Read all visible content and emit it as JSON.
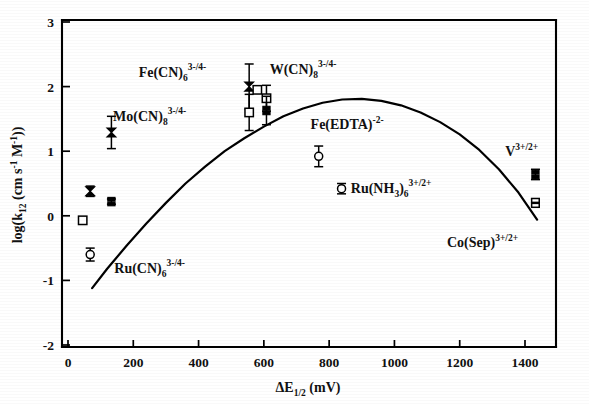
{
  "figure": {
    "background_color": "#ffffff",
    "ink_color": "#000000"
  },
  "axes": {
    "x_title_main": "E",
    "x_title_delta": "Δ",
    "x_title_sub": "1/2",
    "x_title_units": "(mV)",
    "x_title_full": "ΔE1/2 (mV)",
    "y_title_pre": "log(k",
    "y_title_sub": "12",
    "y_title_mid": " (cm s",
    "y_title_sup1": "-1",
    "y_title_mid2": " M",
    "y_title_sup2": "-1",
    "y_title_end": "))",
    "y_title_full": "log(k12 (cm s-1 M-1))",
    "x_ticks": [
      "0",
      "200",
      "400",
      "600",
      "800",
      "1000",
      "1200",
      "1400"
    ],
    "y_ticks": [
      "3",
      "2",
      "1",
      "0",
      "-1",
      "-2"
    ]
  },
  "chart_data": {
    "type": "scatter",
    "title": "",
    "xlabel": "ΔE1/2 (mV)",
    "ylabel": "log(k12 (cm s^-1 M^-1))",
    "xlim": [
      -40,
      1500
    ],
    "ylim": [
      -2,
      3.1
    ],
    "xticks": [
      0,
      200,
      400,
      600,
      800,
      1000,
      1200,
      1400
    ],
    "yticks": [
      -2,
      -1,
      0,
      1,
      2,
      3
    ],
    "grid": false,
    "legend": "none",
    "annotations": [
      {
        "name": "Ru(CN)6",
        "base": "Ru(CN)",
        "sub": "6",
        "sup": "3-/4-",
        "label": "Ru(CN)6 3-/4-",
        "x": 250,
        "y": -0.88
      },
      {
        "name": "Mo(CN)8",
        "base": "Mo(CN)",
        "sub": "8",
        "sup": "3-/4-",
        "label": "Mo(CN)8 3-/4-",
        "x": 250,
        "y": 1.46
      },
      {
        "name": "Fe(CN)6",
        "base": "Fe(CN)",
        "sub": "6",
        "sup": "3-/4-",
        "label": "Fe(CN)6 3-/4-",
        "x": 320,
        "y": 2.15
      },
      {
        "name": "W(CN)8",
        "base": "W(CN)",
        "sub": "8",
        "sup": "3-/4-",
        "label": "W(CN)8 3-/4-",
        "x": 720,
        "y": 2.2
      },
      {
        "name": "Fe(EDTA)",
        "base": "Fe(EDTA)",
        "sub": "",
        "sup": "-2-",
        "label": "Fe(EDTA) -2-",
        "x": 855,
        "y": 1.34
      },
      {
        "name": "Ru(NH3)6",
        "base": "Ru(NH",
        "sub": "3",
        "base2": ")",
        "sub2": "6",
        "sup": "3+/2+",
        "label": "Ru(NH3)6 3+/2+",
        "x": 990,
        "y": 0.35
      },
      {
        "name": "V",
        "base": "V",
        "sub": "",
        "sup": "3+/2+",
        "label": "V 3+/2+",
        "x": 1390,
        "y": 0.92
      },
      {
        "name": "Co(Sep)",
        "base": "Co(Sep)",
        "sub": "",
        "sup": "3+/2+",
        "label": "Co(Sep) 3+/2+",
        "x": 1270,
        "y": -0.48
      }
    ],
    "series": [
      {
        "name": "Marcus cross-relation fit",
        "type": "line",
        "points": [
          {
            "x": 74,
            "y": -1.12
          },
          {
            "x": 120,
            "y": -0.82
          },
          {
            "x": 180,
            "y": -0.46
          },
          {
            "x": 240,
            "y": -0.12
          },
          {
            "x": 300,
            "y": 0.2
          },
          {
            "x": 360,
            "y": 0.5
          },
          {
            "x": 420,
            "y": 0.76
          },
          {
            "x": 480,
            "y": 1.0
          },
          {
            "x": 540,
            "y": 1.2
          },
          {
            "x": 600,
            "y": 1.38
          },
          {
            "x": 660,
            "y": 1.54
          },
          {
            "x": 720,
            "y": 1.66
          },
          {
            "x": 780,
            "y": 1.75
          },
          {
            "x": 840,
            "y": 1.8
          },
          {
            "x": 900,
            "y": 1.81
          },
          {
            "x": 960,
            "y": 1.78
          },
          {
            "x": 1020,
            "y": 1.71
          },
          {
            "x": 1080,
            "y": 1.6
          },
          {
            "x": 1140,
            "y": 1.45
          },
          {
            "x": 1200,
            "y": 1.26
          },
          {
            "x": 1260,
            "y": 1.02
          },
          {
            "x": 1320,
            "y": 0.72
          },
          {
            "x": 1380,
            "y": 0.36
          },
          {
            "x": 1437,
            "y": -0.06
          }
        ]
      },
      {
        "name": "measured rate constants",
        "type": "scatter",
        "points": [
          {
            "x": 68,
            "y": 0.38,
            "marker": "filled-bowtie",
            "yerr": 0.08
          },
          {
            "x": 45,
            "y": -0.07,
            "marker": "open-square",
            "yerr": 0
          },
          {
            "x": 68,
            "y": -0.6,
            "marker": "open-circle",
            "yerr": 0.1
          },
          {
            "x": 133,
            "y": 0.22,
            "marker": "filled-stack",
            "yerr": 0.04
          },
          {
            "x": 133,
            "y": 1.29,
            "marker": "filled-bowtie",
            "yerr": 0.25
          },
          {
            "x": 555,
            "y": 2.0,
            "marker": "filled-bowtie",
            "yerr": 0.35
          },
          {
            "x": 580,
            "y": 1.95,
            "marker": "open-square",
            "yerr": 0
          },
          {
            "x": 555,
            "y": 1.6,
            "marker": "open-square",
            "yerr": 0.28
          },
          {
            "x": 608,
            "y": 1.82,
            "marker": "open-square",
            "yerr": 0.2
          },
          {
            "x": 608,
            "y": 1.63,
            "marker": "filled-stack",
            "yerr": 0.22
          },
          {
            "x": 768,
            "y": 0.92,
            "marker": "open-circle",
            "yerr": 0.16
          },
          {
            "x": 838,
            "y": 0.42,
            "marker": "open-circle",
            "yerr": 0.08
          },
          {
            "x": 1432,
            "y": 0.64,
            "marker": "filled-stack",
            "yerr": 0.08
          },
          {
            "x": 1432,
            "y": 0.2,
            "marker": "open-stack",
            "yerr": 0.06
          }
        ]
      }
    ]
  }
}
